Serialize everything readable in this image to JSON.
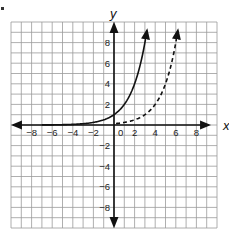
{
  "chart_data": {
    "type": "line",
    "title": "",
    "xlabel": "x",
    "ylabel": "y",
    "xlim": [
      -10,
      10
    ],
    "ylim": [
      -10,
      10
    ],
    "grid": true,
    "x_ticks": [
      -8,
      -6,
      -4,
      -2,
      0,
      2,
      4,
      6,
      8
    ],
    "x_tick_labels": [
      "−8",
      "−6",
      "−4",
      "−2",
      "0",
      "2",
      "4",
      "6",
      "8"
    ],
    "y_ticks": [
      8,
      6,
      4,
      2,
      -2,
      -4,
      -6,
      -8
    ],
    "y_tick_labels": [
      "8",
      "6",
      "4",
      "2",
      "−2",
      "−4",
      "−6",
      "−8"
    ],
    "series": [
      {
        "name": "solid curve",
        "style": "solid",
        "description": "exponential growth, approx y = 2^x",
        "points": [
          [
            -10,
            0.001
          ],
          [
            -6,
            0.016
          ],
          [
            -4,
            0.06
          ],
          [
            -2,
            0.25
          ],
          [
            -1,
            0.5
          ],
          [
            0,
            1
          ],
          [
            1,
            2
          ],
          [
            2,
            4
          ],
          [
            3,
            8
          ],
          [
            3.2,
            9.2
          ]
        ]
      },
      {
        "name": "dashed curve",
        "style": "dashed",
        "description": "exponential growth shifted right, approx y = 2^(x-3)",
        "points": [
          [
            0,
            0.125
          ],
          [
            1,
            0.25
          ],
          [
            2,
            0.5
          ],
          [
            3,
            1
          ],
          [
            4,
            2
          ],
          [
            5,
            4
          ],
          [
            6,
            8
          ],
          [
            6.2,
            9.2
          ]
        ]
      }
    ],
    "legend": "none",
    "colors": {
      "grid": "#9a9a9a",
      "axes": "#111111",
      "curves": "#111111"
    }
  }
}
